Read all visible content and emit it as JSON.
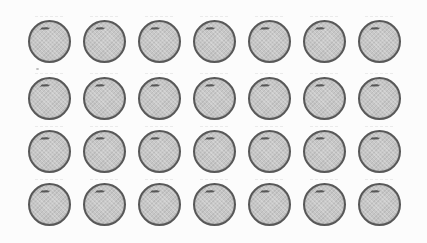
{
  "scene": {
    "description": "Scanned worksheet clipart: grid of orange fruits",
    "item": "orange",
    "rows": 4,
    "columns": 7,
    "total_items": 28
  },
  "style": {
    "background": "#fcfcfc",
    "circle_fill": "#c5c5c5",
    "circle_border": "#585858",
    "stem_color": "#3d3d3d"
  }
}
